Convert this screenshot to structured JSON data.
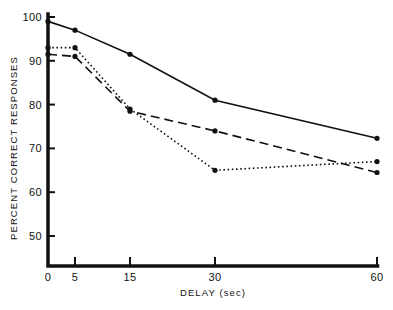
{
  "chart_data": {
    "type": "line",
    "title": "",
    "subtitle": "",
    "xlabel": "DELAY (sec)",
    "ylabel": "PERCENT CORRECT RESPONSES",
    "x": [
      0,
      5,
      15,
      30,
      60
    ],
    "x_tick_labels": [
      "0",
      "5",
      "15",
      "30",
      "60"
    ],
    "y_tick_labels": [
      "50",
      "60",
      "70",
      "80",
      "90",
      "100"
    ],
    "y_ticks": [
      50,
      60,
      70,
      80,
      90,
      100
    ],
    "ylim": [
      50,
      100
    ],
    "x_axis_scale": "categorical-unequal",
    "grid": false,
    "legend": "none",
    "annotations": [],
    "series": [
      {
        "name": "solid",
        "style": "solid",
        "marker": "filled-circle",
        "values": [
          99.0,
          97.0,
          91.5,
          81.0,
          72.3
        ]
      },
      {
        "name": "dotted",
        "style": "dotted",
        "marker": "filled-circle",
        "values": [
          93.0,
          93.0,
          79.0,
          65.0,
          67.0
        ]
      },
      {
        "name": "dashed",
        "style": "dashed",
        "marker": "filled-circle",
        "values": [
          91.5,
          91.0,
          78.5,
          74.0,
          64.5
        ]
      }
    ]
  },
  "geometry": {
    "x_pixels": [
      48,
      75,
      130,
      215,
      377
    ],
    "y_top_value": 100,
    "y_top_pixel": 17,
    "y_bottom_value": 50,
    "y_bottom_pixel": 236,
    "axis_x_pixel": 48,
    "axis_y_pixel": 266,
    "tick_len": 7,
    "axis_stroke": 3.5,
    "series_stroke": 1.6,
    "marker_radius": 2.6
  },
  "colors": {
    "ink": "#111111",
    "background": "#ffffff"
  }
}
